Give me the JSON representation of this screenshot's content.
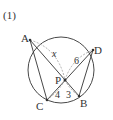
{
  "problem_label": "(1)",
  "points": {
    "A": {
      "label": "A",
      "x": 30,
      "y": 40
    },
    "B": {
      "label": "B",
      "x": 79,
      "y": 96
    },
    "C": {
      "label": "C",
      "x": 47,
      "y": 100
    },
    "D": {
      "label": "D",
      "x": 93,
      "y": 50
    },
    "P": {
      "label": "P",
      "x": 65,
      "y": 80
    }
  },
  "circle": {
    "cx": 61,
    "cy": 70,
    "r": 33
  },
  "segment_labels": {
    "AP": "x",
    "PD": "6",
    "PC": "4",
    "PB": "3"
  },
  "colors": {
    "stroke": "#333333",
    "dashed": "#999999"
  }
}
